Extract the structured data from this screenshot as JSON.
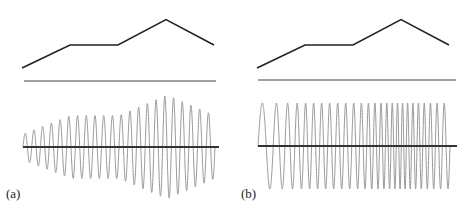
{
  "panels": [
    {
      "label": "(a)",
      "envelope_points": [
        [
          0,
          0
        ],
        [
          0.25,
          0.45
        ],
        [
          0.5,
          0.45
        ],
        [
          0.75,
          0.95
        ],
        [
          1,
          0.45
        ]
      ],
      "signal": {
        "type": "amplitude-modulated",
        "cycles": 22,
        "amplitude_range": [
          0.25,
          1.0
        ]
      }
    },
    {
      "label": "(b)",
      "envelope_points": [
        [
          0,
          0
        ],
        [
          0.25,
          0.45
        ],
        [
          0.5,
          0.45
        ],
        [
          0.75,
          0.95
        ],
        [
          1,
          0.45
        ]
      ],
      "signal": {
        "type": "frequency-modulated",
        "cycles": 26,
        "amplitude": 0.9
      }
    }
  ],
  "colors": {
    "envelope": "#222222",
    "baseline": "#333333",
    "signal": "#9a9a9a"
  }
}
